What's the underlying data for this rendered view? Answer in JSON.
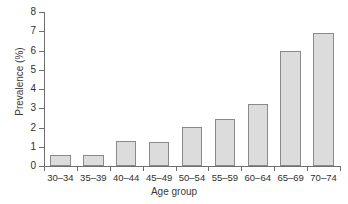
{
  "chart_data": {
    "type": "bar",
    "title": "",
    "subtitle": "",
    "xlabel": "Age group",
    "ylabel": "Prevalence (%)",
    "categories": [
      "30–34",
      "35–39",
      "40–44",
      "45–49",
      "50–54",
      "55–59",
      "60–64",
      "65–69",
      "70–74"
    ],
    "values": [
      0.58,
      0.58,
      1.3,
      1.27,
      2.02,
      2.45,
      3.2,
      5.95,
      6.9
    ],
    "ylim": [
      0,
      8
    ],
    "xlim_categories": 9,
    "yticks": [
      "0",
      "1",
      "2",
      "3",
      "4",
      "5",
      "6",
      "7",
      "8"
    ],
    "ytick_values": [
      0,
      1,
      2,
      3,
      4,
      5,
      6,
      7,
      8
    ],
    "grid": false,
    "legend": null,
    "legend_position": "none",
    "bar_fill_color": "#dcdcdc",
    "bar_border_color": "#8a8a8a",
    "axis_color": "#6e6e6e",
    "text_color": "#2f2f2f",
    "background_color": "#ffffff",
    "annotations": []
  }
}
